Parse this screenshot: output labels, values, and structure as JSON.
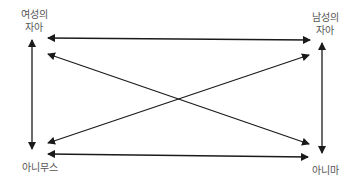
{
  "diagram": {
    "nodes": {
      "female_ego": {
        "label": "여성의\n자아",
        "x": 17,
        "y": 8,
        "w": 34
      },
      "male_ego": {
        "label": "남성의\n자아",
        "x": 308,
        "y": 11,
        "w": 34
      },
      "animus": {
        "label": "아니무스",
        "x": 15,
        "y": 161,
        "w": 50
      },
      "anima": {
        "label": "아니마",
        "x": 305,
        "y": 164,
        "w": 40
      }
    },
    "edges": [
      {
        "from": "female_ego",
        "to": "male_ego",
        "type": "bidirectional"
      },
      {
        "from": "animus",
        "to": "anima",
        "type": "bidirectional"
      },
      {
        "from": "female_ego",
        "to": "animus",
        "type": "bidirectional"
      },
      {
        "from": "male_ego",
        "to": "anima",
        "type": "bidirectional"
      },
      {
        "from": "female_ego",
        "to": "anima",
        "type": "bidirectional"
      },
      {
        "from": "animus",
        "to": "male_ego",
        "type": "bidirectional"
      }
    ],
    "colors": {
      "line": "#1a1a1a",
      "text": "#555555"
    }
  }
}
